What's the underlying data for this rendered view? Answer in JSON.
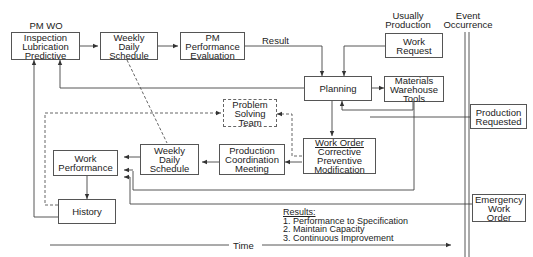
{
  "labels": {
    "pm_wo": "PM WO",
    "usually_production": [
      "Usually",
      "Production"
    ],
    "event_occurrence": [
      "Event",
      "Occurrence"
    ],
    "result": "Result",
    "time": "Time"
  },
  "boxes": {
    "inspection": [
      "Inspection",
      "Lubrication",
      "Predictive"
    ],
    "weekly_top": [
      "Weekly",
      "Daily",
      "Schedule"
    ],
    "pm_eval": [
      "PM",
      "Performance",
      "Evaluation"
    ],
    "work_request": [
      "Work",
      "Request"
    ],
    "planning": [
      "Planning"
    ],
    "materials": [
      "Materials",
      "Warehouse",
      "Tools"
    ],
    "problem_solving": [
      "Problem",
      "Solving",
      "Team"
    ],
    "production_requested": [
      "Production",
      "Requested"
    ],
    "work_order_title": "Work Order",
    "work_order": [
      "Corrective",
      "Preventive",
      "Modification"
    ],
    "coordination": [
      "Production",
      "Coordination",
      "Meeting"
    ],
    "weekly_bottom": [
      "Weekly",
      "Daily",
      "Schedule"
    ],
    "work_performance": [
      "Work",
      "Performance"
    ],
    "history": [
      "History"
    ],
    "emergency": [
      "Emergency",
      "Work",
      "Order"
    ]
  },
  "results": {
    "title": "Results:",
    "items": [
      "1. Performance to Specification",
      "2. Maintain Capacity",
      "3. Continuous Improvement"
    ]
  },
  "colors": {
    "line": "#444444",
    "border": "#555555",
    "text": "#222222"
  }
}
